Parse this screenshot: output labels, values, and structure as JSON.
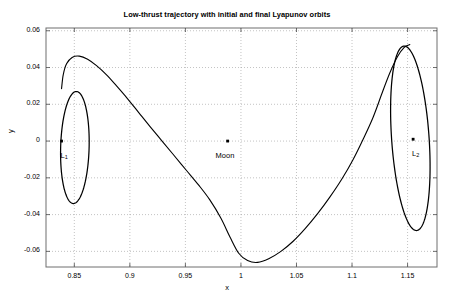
{
  "chart_data": {
    "type": "line",
    "title": "Low-thrust trajectory with initial and final Lyapunov orbits",
    "xlabel": "x",
    "ylabel": "y",
    "xlim": [
      0.8245,
      1.1765
    ],
    "ylim": [
      -0.0685,
      0.0615
    ],
    "xticks": [
      0.85,
      0.9,
      0.95,
      1,
      1.05,
      1.1,
      1.15
    ],
    "xticklabels": [
      "0.85",
      "0.9",
      "0.95",
      "1",
      "1.05",
      "1.1",
      "1.15"
    ],
    "yticks": [
      -0.06,
      -0.04,
      -0.02,
      0,
      0.02,
      0.04,
      0.06
    ],
    "yticklabels": [
      "-0.06",
      "-0.04",
      "-0.02",
      "0",
      "0.02",
      "0.04",
      "0.06"
    ],
    "grid": true,
    "grid_style": "dotted",
    "legend": null,
    "line_color": "#000000",
    "series": [
      {
        "name": "initial-lyapunov-orbit-L1",
        "kind": "closed-orbit",
        "center": [
          0.8505,
          -0.0035
        ],
        "semi_x": 0.0128,
        "semi_y": 0.0305,
        "tilt_deg": -3
      },
      {
        "name": "final-lyapunov-orbit-L2",
        "kind": "closed-orbit",
        "center": [
          1.1525,
          0.0015
        ],
        "semi_x": 0.0168,
        "semi_y": 0.0505,
        "tilt_deg": 7
      },
      {
        "name": "low-thrust-transfer-trajectory",
        "kind": "open-arc",
        "x": [
          0.8385,
          0.84,
          0.843,
          0.848,
          0.8545,
          0.862,
          0.87,
          0.879,
          0.888,
          0.898,
          0.908,
          0.918,
          0.929,
          0.94,
          0.951,
          0.962,
          0.972,
          0.982,
          0.99,
          0.998,
          1.006,
          1.015,
          1.025,
          1.036,
          1.047,
          1.058,
          1.069,
          1.08,
          1.091,
          1.101,
          1.11,
          1.119,
          1.127,
          1.134,
          1.141,
          1.147,
          1.152
        ],
        "y": [
          0.0285,
          0.036,
          0.042,
          0.0455,
          0.0462,
          0.0445,
          0.041,
          0.036,
          0.03,
          0.023,
          0.0155,
          0.008,
          0.0,
          -0.008,
          -0.016,
          -0.024,
          -0.032,
          -0.042,
          -0.052,
          -0.061,
          -0.065,
          -0.066,
          -0.064,
          -0.06,
          -0.0545,
          -0.0475,
          -0.0395,
          -0.0305,
          -0.0205,
          -0.01,
          0.001,
          0.013,
          0.026,
          0.037,
          0.046,
          0.051,
          0.0525
        ]
      }
    ],
    "markers": [
      {
        "name": "L1-point",
        "x": 0.8385,
        "y": 0.0,
        "label": "L",
        "sub": "1",
        "label_dx": -1,
        "label_dy": 10
      },
      {
        "name": "moon-point",
        "x": 0.988,
        "y": 0.0,
        "label": "Moon",
        "sub": "",
        "label_dx": -12,
        "label_dy": 10
      },
      {
        "name": "L2-point",
        "x": 1.155,
        "y": 0.001,
        "label": "L",
        "sub": "2",
        "label_dx": -1,
        "label_dy": 10
      }
    ]
  },
  "labels": {
    "L1": "L",
    "L1_sub": "1",
    "L2": "L",
    "L2_sub": "2",
    "moon": "Moon"
  }
}
